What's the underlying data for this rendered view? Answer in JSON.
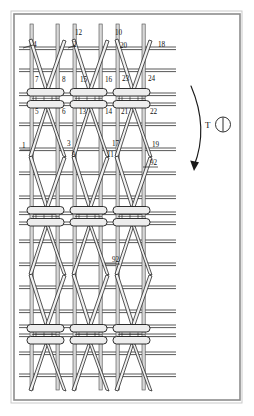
{
  "figure": {
    "background_color": "#ffffff",
    "border_color": "#8d8d8d",
    "line_color": "#1a1a1a",
    "fill_color": "#f2f2f2"
  },
  "rotation_symbol": {
    "label": "T",
    "name": "torque-rotation-indicator",
    "glyph": "circle-with-vertical-line"
  },
  "arrow": {
    "name": "curved-direction-arrow",
    "direction": "downward-curving-left"
  },
  "callouts": [
    {
      "id": "c4",
      "text": "4",
      "x": 33,
      "y": 47
    },
    {
      "id": "c2",
      "text": "2",
      "x": 73,
      "y": 47
    },
    {
      "id": "c12",
      "text": "12",
      "x": 75,
      "y": 35
    },
    {
      "id": "c10",
      "text": "10",
      "x": 115,
      "y": 35
    },
    {
      "id": "c20",
      "text": "20",
      "x": 120,
      "y": 48
    },
    {
      "id": "c18",
      "text": "18",
      "x": 158,
      "y": 47
    },
    {
      "id": "c7",
      "text": "7",
      "x": 35,
      "y": 82
    },
    {
      "id": "c8",
      "text": "8",
      "x": 62,
      "y": 82
    },
    {
      "id": "c15",
      "text": "15",
      "x": 80,
      "y": 82
    },
    {
      "id": "c16",
      "text": "16",
      "x": 105,
      "y": 82
    },
    {
      "id": "c23",
      "text": "23",
      "x": 122,
      "y": 81
    },
    {
      "id": "c24",
      "text": "24",
      "x": 148,
      "y": 81
    },
    {
      "id": "c5",
      "text": "5",
      "x": 35,
      "y": 114
    },
    {
      "id": "c6",
      "text": "6",
      "x": 62,
      "y": 114
    },
    {
      "id": "c13",
      "text": "13",
      "x": 79,
      "y": 114
    },
    {
      "id": "c14",
      "text": "14",
      "x": 105,
      "y": 114
    },
    {
      "id": "c21",
      "text": "21",
      "x": 121,
      "y": 114
    },
    {
      "id": "c22",
      "text": "22",
      "x": 150,
      "y": 114
    },
    {
      "id": "c1",
      "text": "1",
      "x": 22,
      "y": 148
    },
    {
      "id": "c3",
      "text": "3",
      "x": 67,
      "y": 146
    },
    {
      "id": "c9",
      "text": "9",
      "x": 72,
      "y": 157
    },
    {
      "id": "c11",
      "text": "11",
      "x": 107,
      "y": 157
    },
    {
      "id": "c17",
      "text": "17",
      "x": 112,
      "y": 146
    },
    {
      "id": "c19",
      "text": "19",
      "x": 152,
      "y": 147
    },
    {
      "id": "c92a",
      "text": "92",
      "x": 150,
      "y": 165
    },
    {
      "id": "c92b",
      "text": "92",
      "x": 112,
      "y": 262
    }
  ]
}
